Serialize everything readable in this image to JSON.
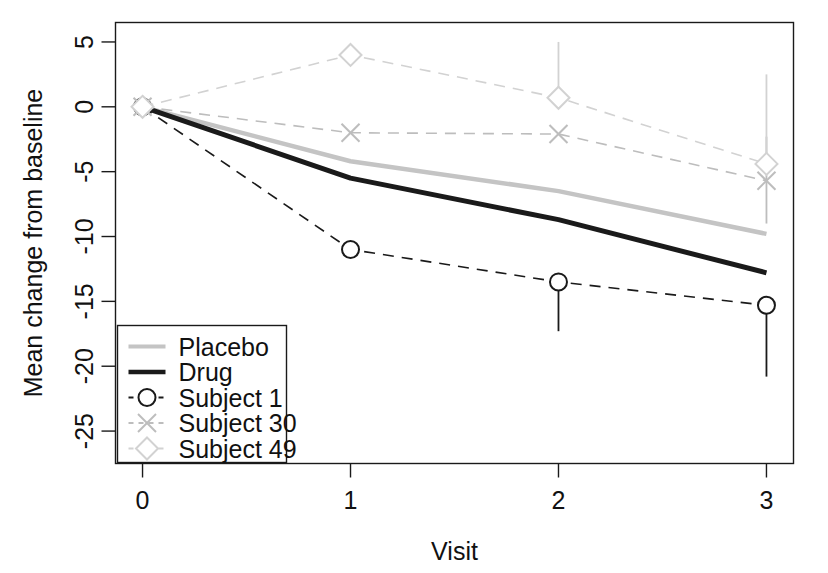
{
  "chart_data": {
    "type": "line",
    "title": "",
    "xlabel": "Visit",
    "ylabel": "Mean change from baseline",
    "x": [
      0,
      1,
      2,
      3
    ],
    "xticks": [
      "0",
      "1",
      "2",
      "3"
    ],
    "yticks": [
      "5",
      "0",
      "-5",
      "-10",
      "-15",
      "-20",
      "-25"
    ],
    "ytickvalues": [
      5,
      0,
      -5,
      -10,
      -15,
      -20,
      -25
    ],
    "xlim": [
      -0.13,
      3.13
    ],
    "ylim": [
      -27.5,
      6.5
    ],
    "grid": false,
    "legend_position": "bottom-left",
    "series": [
      {
        "name": "Placebo",
        "values": [
          0,
          -4.2,
          -6.5,
          -9.8
        ],
        "color": "#c4c4c4",
        "width": 4.5,
        "dash": "none",
        "marker": "none",
        "errorbars": []
      },
      {
        "name": "Drug",
        "values": [
          0,
          -5.5,
          -8.7,
          -12.8
        ],
        "color": "#1a1a1a",
        "width": 5.0,
        "dash": "none",
        "marker": "none",
        "errorbars": []
      },
      {
        "name": "Subject 1",
        "values": [
          0,
          -11.0,
          -13.5,
          -15.3
        ],
        "color": "#1a1a1a",
        "width": 1.6,
        "dash": "dashed",
        "marker": "circle",
        "errorbars": [
          null,
          null,
          [
            -13.5,
            -17.3
          ],
          [
            -15.3,
            -20.8
          ]
        ]
      },
      {
        "name": "Subject 30",
        "values": [
          0,
          -2.0,
          -2.1,
          -5.7
        ],
        "color": "#bdbdbd",
        "width": 1.6,
        "dash": "dashed",
        "marker": "cross",
        "errorbars": [
          null,
          null,
          null,
          [
            -2.3,
            -9.0
          ]
        ]
      },
      {
        "name": "Subject 49",
        "values": [
          0,
          4.0,
          0.7,
          -4.4
        ],
        "color": "#d2d2d2",
        "width": 1.6,
        "dash": "dashed",
        "marker": "diamond",
        "errorbars": [
          null,
          null,
          [
            5.0,
            0.7
          ],
          [
            2.5,
            -4.4
          ]
        ]
      }
    ]
  },
  "legend": {
    "items": [
      {
        "label": "Placebo"
      },
      {
        "label": "Drug"
      },
      {
        "label": "Subject 1"
      },
      {
        "label": "Subject 30"
      },
      {
        "label": "Subject 49"
      }
    ]
  },
  "colors": {
    "axis": "#1a1a1a",
    "text": "#111111",
    "background": "#ffffff",
    "placebo": "#c4c4c4",
    "drug": "#1a1a1a",
    "subject1": "#1a1a1a",
    "subject30": "#bdbdbd",
    "subject49": "#d2d2d2"
  }
}
